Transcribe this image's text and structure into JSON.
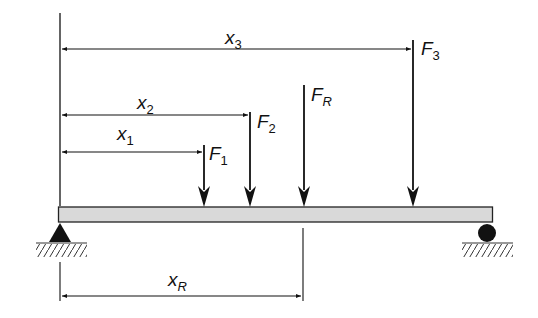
{
  "diagram": {
    "type": "simply-supported-beam-resultant-force",
    "colors": {
      "line": "#111111",
      "beam_fill": "#d9d9d9",
      "background": "#ffffff"
    },
    "beam": {
      "x_start": 58,
      "x_end": 493,
      "y_top": 207,
      "y_bottom": 222
    },
    "supports": [
      {
        "type": "pin",
        "symbol": "triangle",
        "x": 60
      },
      {
        "type": "roller",
        "symbol": "circle",
        "x": 487
      }
    ],
    "forces": [
      {
        "id": "F1",
        "label_main": "F",
        "label_sub": "1",
        "x": 204,
        "y_top": 145
      },
      {
        "id": "F2",
        "label_main": "F",
        "label_sub": "2",
        "x": 250,
        "y_top": 112
      },
      {
        "id": "FR",
        "label_main": "F",
        "label_sub": "R",
        "x": 304,
        "y_top": 85
      },
      {
        "id": "F3",
        "label_main": "F",
        "label_sub": "3",
        "x": 413,
        "y_top": 40
      }
    ],
    "dimensions": [
      {
        "id": "x3",
        "label_main": "x",
        "label_sub": "3",
        "from": 60,
        "to": 411,
        "y": 49
      },
      {
        "id": "x2",
        "label_main": "x",
        "label_sub": "2",
        "from": 60,
        "to": 248,
        "y": 115
      },
      {
        "id": "x1",
        "label_main": "x",
        "label_sub": "1",
        "from": 60,
        "to": 202,
        "y": 152
      },
      {
        "id": "xR",
        "label_main": "x",
        "label_sub": "R",
        "from": 60,
        "to": 303,
        "y": 296
      }
    ]
  }
}
